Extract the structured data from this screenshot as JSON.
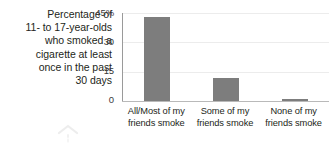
{
  "caption": {
    "lines": [
      "Percentage of",
      "11- to 17-year-olds",
      "who smoked a",
      "cigarette at least",
      "once in the past",
      "30 days"
    ]
  },
  "axis": {
    "y_ticks": [
      "45%",
      "30",
      "15",
      "0"
    ]
  },
  "colors": {
    "bar": "#7d7d7d",
    "grid": "#ececec",
    "axis": "#9a9a9a",
    "text": "#231f20"
  },
  "chart_data": {
    "type": "bar",
    "title": "",
    "xlabel": "",
    "ylabel": "Percentage of 11- to 17-year-olds who smoked a cigarette at least once in the past 30 days",
    "ylim": [
      0,
      45
    ],
    "yticks": [
      0,
      15,
      30,
      45
    ],
    "ytick_labels": [
      "0",
      "15",
      "30",
      "45%"
    ],
    "grid": true,
    "legend": "none",
    "categories": [
      "All/Most of my friends smoke",
      "Some of my friends smoke",
      "None of my friends smoke"
    ],
    "category_lines": [
      [
        "All/Most of my",
        "friends smoke"
      ],
      [
        "Some of my",
        "friends smoke"
      ],
      [
        "None of my",
        "friends smoke"
      ]
    ],
    "values": [
      43,
      12,
      1
    ]
  },
  "decoration": {
    "chevron": "chevron-up-watermark"
  }
}
